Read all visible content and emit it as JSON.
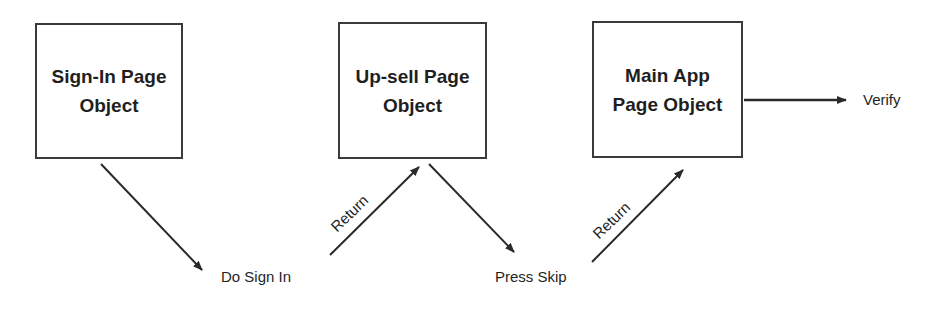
{
  "diagram": {
    "type": "flow",
    "nodes": [
      {
        "id": "sign-in",
        "label": "Sign-In Page\nObject"
      },
      {
        "id": "up-sell",
        "label": "Up-sell Page\nObject"
      },
      {
        "id": "main-app",
        "label": "Main App\nPage Object"
      }
    ],
    "actions": [
      {
        "id": "do-sign-in",
        "label": "Do Sign In"
      },
      {
        "id": "press-skip",
        "label": "Press Skip"
      },
      {
        "id": "verify",
        "label": "Verify"
      }
    ],
    "edge_labels": {
      "return_1": "Return",
      "return_2": "Return"
    },
    "edges": [
      {
        "from": "sign-in",
        "to": "do-sign-in",
        "label": ""
      },
      {
        "from": "do-sign-in",
        "to": "up-sell",
        "label": "Return"
      },
      {
        "from": "up-sell",
        "to": "press-skip",
        "label": ""
      },
      {
        "from": "press-skip",
        "to": "main-app",
        "label": "Return"
      },
      {
        "from": "main-app",
        "to": "verify",
        "label": ""
      }
    ],
    "colors": {
      "stroke": "#2a2a2a",
      "text": "#1f1f1f",
      "background": "#ffffff"
    }
  }
}
